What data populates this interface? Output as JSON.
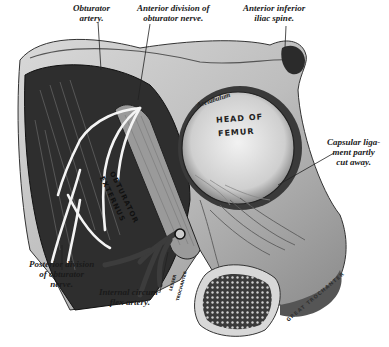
{
  "figure": {
    "colors": {
      "background": "#ffffff",
      "bone_light": "#e6e6e6",
      "bone_mid": "#b5b5b5",
      "shadow": "#2a2a2a",
      "label": "#1a1a1a"
    }
  },
  "labels": {
    "obturator_artery": {
      "line1": "Obturator",
      "line2": "artery."
    },
    "anterior_division": {
      "line1": "Anterior division of",
      "line2": "obturator nerve."
    },
    "anterior_inferior_iliac_spine": {
      "line1": "Anterior inferior",
      "line2": "iliac spine."
    },
    "capsular_ligament": {
      "line1": "Capsular liga-",
      "line2": "ment partly",
      "line3": "cut away."
    },
    "posterior_division": {
      "line1": "Posterior division",
      "line2": "of obturator",
      "line3": "nerve."
    },
    "internal_circumflex": {
      "line1": "Internal circum-",
      "line2": "flex artery."
    }
  },
  "inline_labels": {
    "acetabulum": "Acetabulum",
    "head_of_femur_1": "HEAD OF",
    "head_of_femur_2": "FEMUR",
    "obturator_externus_1": "OBTURATOR",
    "obturator_externus_2": "EXTERNUS",
    "lesser_trochanter_1": "LESSER",
    "lesser_trochanter_2": "TROCHANTER",
    "great_trochanter": "GREAT TROCHANTER"
  }
}
